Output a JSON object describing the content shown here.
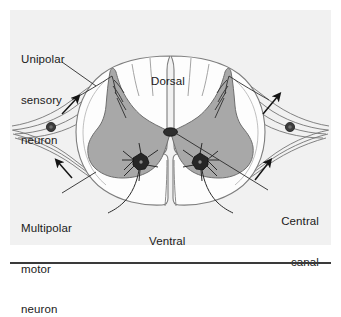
{
  "figure": {
    "panel_background": "#f1f1f1",
    "page_background": "#ffffff",
    "rule_color": "#3a3a3a"
  },
  "labels": {
    "unipolar_sensory_neuron": {
      "line1": "Unipolar",
      "line2": "sensory",
      "line3": "neuron"
    },
    "multipolar_motor_neuron": {
      "line1": "Multipolar",
      "line2": "motor",
      "line3": "neuron"
    },
    "dorsal": "Dorsal",
    "ventral": "Ventral",
    "central_canal": {
      "line1": "Central",
      "line2": "canal"
    }
  },
  "colors": {
    "gray_matter": "#a8a8a8",
    "gray_matter_stroke": "#6e6e6e",
    "white_matter": "#fdfdfd",
    "white_matter_stroke": "#8a8a8a",
    "outline": "#555555",
    "nerve_stroke": "#6a6a6a",
    "neuron_body": "#2a2a2a",
    "arrow": "#141414",
    "text": "#1a1a1a",
    "central_canal": "#2e2e2e"
  },
  "structures": {
    "gray_matter": "butterfly-shaped gray matter",
    "white_matter": "surrounding white matter",
    "central_canal": "small dark oval at center of gray matter",
    "dorsal_horn_left": "left dorsal (posterior) horn",
    "dorsal_horn_right": "right dorsal (posterior) horn",
    "ventral_horn_left": "left ventral (anterior) horn",
    "ventral_horn_right": "right ventral (anterior) horn",
    "dorsal_root_ganglion_left": "left dorsal root ganglion cell body",
    "dorsal_root_ganglion_right": "right dorsal root ganglion cell body",
    "motor_neuron_left": "left multipolar motor neuron soma",
    "motor_neuron_right": "right multipolar motor neuron soma"
  },
  "arrows": {
    "upper_left": "sensory afferent direction, pointing toward cord",
    "lower_left": "motor efferent direction, pointing away from cord",
    "upper_right": "sensory afferent direction, pointing toward cord",
    "lower_right": "motor efferent direction, pointing away from cord"
  }
}
